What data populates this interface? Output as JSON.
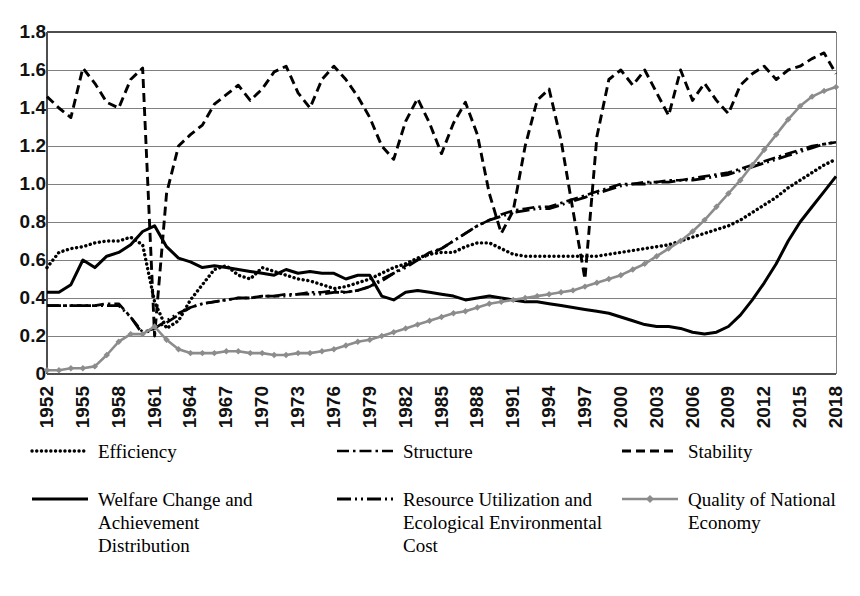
{
  "chart_data": {
    "type": "line",
    "title": "",
    "subtitle": "",
    "xlabel": "",
    "ylabel": "",
    "ylim": [
      0,
      1.8
    ],
    "xlim": [
      1952,
      2018
    ],
    "grid": true,
    "legend_position": "bottom",
    "ytick_labels": [
      "1.8",
      "1.6",
      "1.4",
      "1.2",
      "1.0",
      "0.8",
      "0.6",
      "0.4",
      "0.2",
      "0"
    ],
    "ytick_values": [
      1.8,
      1.6,
      1.4,
      1.2,
      1.0,
      0.8,
      0.6,
      0.4,
      0.2,
      0
    ],
    "xtick_labels": [
      "1952",
      "1955",
      "1958",
      "1961",
      "1964",
      "1967",
      "1970",
      "1973",
      "1976",
      "1979",
      "1982",
      "1985",
      "1988",
      "1991",
      "1994",
      "1997",
      "2000",
      "2003",
      "2006",
      "2009",
      "2012",
      "2015",
      "2018"
    ],
    "x": [
      1952,
      1953,
      1954,
      1955,
      1956,
      1957,
      1958,
      1959,
      1960,
      1961,
      1962,
      1963,
      1964,
      1965,
      1966,
      1967,
      1968,
      1969,
      1970,
      1971,
      1972,
      1973,
      1974,
      1975,
      1976,
      1977,
      1978,
      1979,
      1980,
      1981,
      1982,
      1983,
      1984,
      1985,
      1986,
      1987,
      1988,
      1989,
      1990,
      1991,
      1992,
      1993,
      1994,
      1995,
      1996,
      1997,
      1998,
      1999,
      2000,
      2001,
      2002,
      2003,
      2004,
      2005,
      2006,
      2007,
      2008,
      2009,
      2010,
      2011,
      2012,
      2013,
      2014,
      2015,
      2016,
      2017,
      2018
    ],
    "series": [
      {
        "name": "Efficiency",
        "style": "dotted",
        "color": "#000000",
        "values": [
          0.56,
          0.64,
          0.66,
          0.67,
          0.69,
          0.7,
          0.7,
          0.72,
          0.68,
          0.38,
          0.24,
          0.28,
          0.39,
          0.47,
          0.55,
          0.57,
          0.52,
          0.5,
          0.56,
          0.54,
          0.52,
          0.5,
          0.49,
          0.47,
          0.45,
          0.46,
          0.48,
          0.5,
          0.53,
          0.56,
          0.58,
          0.61,
          0.63,
          0.64,
          0.64,
          0.67,
          0.69,
          0.69,
          0.66,
          0.63,
          0.62,
          0.62,
          0.62,
          0.62,
          0.62,
          0.62,
          0.62,
          0.63,
          0.64,
          0.65,
          0.66,
          0.67,
          0.68,
          0.7,
          0.72,
          0.74,
          0.76,
          0.78,
          0.81,
          0.85,
          0.89,
          0.93,
          0.98,
          1.02,
          1.06,
          1.1,
          1.13
        ]
      },
      {
        "name": "Structure",
        "style": "dashdot",
        "color": "#000000",
        "values": [
          0.36,
          0.36,
          0.36,
          0.36,
          0.36,
          0.37,
          0.37,
          0.3,
          0.22,
          0.24,
          0.27,
          0.31,
          0.35,
          0.37,
          0.38,
          0.39,
          0.4,
          0.4,
          0.41,
          0.41,
          0.42,
          0.42,
          0.43,
          0.43,
          0.44,
          0.43,
          0.44,
          0.46,
          0.5,
          0.53,
          0.57,
          0.6,
          0.64,
          0.66,
          0.7,
          0.74,
          0.78,
          0.81,
          0.84,
          0.86,
          0.87,
          0.88,
          0.88,
          0.9,
          0.92,
          0.94,
          0.96,
          0.98,
          1.0,
          1.0,
          1.01,
          1.01,
          1.02,
          1.02,
          1.03,
          1.04,
          1.05,
          1.06,
          1.08,
          1.1,
          1.12,
          1.14,
          1.16,
          1.18,
          1.2,
          1.21,
          1.22
        ]
      },
      {
        "name": "Stability",
        "style": "dashed",
        "color": "#000000",
        "values": [
          1.46,
          1.4,
          1.35,
          1.61,
          1.53,
          1.43,
          1.4,
          1.55,
          1.61,
          0.2,
          0.95,
          1.2,
          1.26,
          1.31,
          1.42,
          1.47,
          1.52,
          1.44,
          1.5,
          1.59,
          1.62,
          1.48,
          1.4,
          1.55,
          1.62,
          1.55,
          1.46,
          1.35,
          1.2,
          1.13,
          1.33,
          1.45,
          1.32,
          1.16,
          1.32,
          1.43,
          1.26,
          0.95,
          0.74,
          0.86,
          1.2,
          1.44,
          1.5,
          1.23,
          0.86,
          0.5,
          1.25,
          1.55,
          1.6,
          1.52,
          1.6,
          1.48,
          1.36,
          1.6,
          1.44,
          1.53,
          1.44,
          1.37,
          1.52,
          1.58,
          1.62,
          1.55,
          1.6,
          1.62,
          1.66,
          1.69,
          1.58
        ]
      },
      {
        "name": "Welfare Change and Achievement Distribution",
        "style": "solid",
        "color": "#000000",
        "values": [
          0.43,
          0.43,
          0.47,
          0.6,
          0.56,
          0.62,
          0.64,
          0.68,
          0.75,
          0.78,
          0.67,
          0.61,
          0.59,
          0.56,
          0.57,
          0.56,
          0.55,
          0.54,
          0.53,
          0.52,
          0.55,
          0.53,
          0.54,
          0.53,
          0.53,
          0.5,
          0.52,
          0.52,
          0.41,
          0.39,
          0.43,
          0.44,
          0.43,
          0.42,
          0.41,
          0.39,
          0.4,
          0.41,
          0.4,
          0.39,
          0.38,
          0.38,
          0.37,
          0.36,
          0.35,
          0.34,
          0.33,
          0.32,
          0.3,
          0.28,
          0.26,
          0.25,
          0.25,
          0.24,
          0.22,
          0.21,
          0.22,
          0.25,
          0.31,
          0.39,
          0.48,
          0.58,
          0.7,
          0.8,
          0.88,
          0.96,
          1.04
        ]
      },
      {
        "name": "Resource Utilization and Ecological Environmental Cost",
        "style": "longdashdotdot",
        "color": "#000000",
        "values": [
          0.36,
          0.36,
          0.36,
          0.36,
          0.36,
          0.36,
          0.36,
          0.3,
          0.21,
          0.24,
          0.28,
          0.32,
          0.35,
          0.37,
          0.38,
          0.39,
          0.4,
          0.4,
          0.41,
          0.41,
          0.41,
          0.42,
          0.42,
          0.42,
          0.43,
          0.43,
          0.44,
          0.46,
          0.49,
          0.53,
          0.56,
          0.6,
          0.63,
          0.66,
          0.7,
          0.74,
          0.78,
          0.81,
          0.83,
          0.85,
          0.86,
          0.87,
          0.87,
          0.89,
          0.91,
          0.93,
          0.95,
          0.97,
          0.99,
          1.0,
          1.0,
          1.01,
          1.01,
          1.02,
          1.02,
          1.03,
          1.04,
          1.05,
          1.07,
          1.09,
          1.11,
          1.13,
          1.15,
          1.17,
          1.19,
          1.21,
          1.22
        ]
      },
      {
        "name": "Quality of National Economy",
        "style": "solid-marker",
        "color": "#8c8c8c",
        "values": [
          0.02,
          0.02,
          0.03,
          0.03,
          0.04,
          0.1,
          0.17,
          0.21,
          0.21,
          0.25,
          0.18,
          0.13,
          0.11,
          0.11,
          0.11,
          0.12,
          0.12,
          0.11,
          0.11,
          0.1,
          0.1,
          0.11,
          0.11,
          0.12,
          0.13,
          0.15,
          0.17,
          0.18,
          0.2,
          0.22,
          0.24,
          0.26,
          0.28,
          0.3,
          0.32,
          0.33,
          0.35,
          0.37,
          0.38,
          0.39,
          0.4,
          0.41,
          0.42,
          0.43,
          0.44,
          0.46,
          0.48,
          0.5,
          0.52,
          0.55,
          0.58,
          0.62,
          0.66,
          0.7,
          0.75,
          0.81,
          0.88,
          0.95,
          1.02,
          1.1,
          1.18,
          1.26,
          1.34,
          1.41,
          1.46,
          1.49,
          1.51
        ]
      }
    ]
  },
  "legend": {
    "rows": [
      [
        {
          "label": "Efficiency",
          "style": "dotted",
          "color": "#000000"
        },
        {
          "label": "Structure",
          "style": "dashdot",
          "color": "#000000"
        },
        {
          "label": "Stability",
          "style": "dashed",
          "color": "#000000"
        }
      ],
      [
        {
          "label": "Welfare Change and\nAchievement\nDistribution",
          "style": "solid",
          "color": "#000000"
        },
        {
          "label": "Resource Utilization and\nEcological Environmental\nCost",
          "style": "longdashdotdot",
          "color": "#000000"
        },
        {
          "label": "Quality of National\nEconomy",
          "style": "solid-marker",
          "color": "#8c8c8c"
        }
      ]
    ]
  },
  "colors": {
    "grid": "#808080",
    "axis": "#595959",
    "series_black": "#000000",
    "series_gray": "#8c8c8c",
    "background": "#ffffff"
  }
}
